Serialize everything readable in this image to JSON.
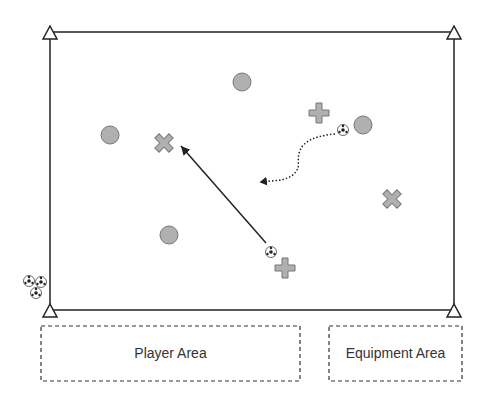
{
  "diagram": {
    "field": {
      "x": 50,
      "y": 32,
      "width": 404,
      "height": 278,
      "stroke": "#222"
    },
    "cones": [
      {
        "x": 50,
        "y": 32
      },
      {
        "x": 454,
        "y": 32
      },
      {
        "x": 50,
        "y": 310
      },
      {
        "x": 454,
        "y": 310
      }
    ],
    "circles": [
      {
        "x": 242,
        "y": 82
      },
      {
        "x": 110,
        "y": 135
      },
      {
        "x": 363,
        "y": 125
      },
      {
        "x": 169,
        "y": 235
      }
    ],
    "crosses": [
      {
        "x": 164,
        "y": 143,
        "rot": 45
      },
      {
        "x": 319,
        "y": 113,
        "rot": 0
      },
      {
        "x": 392,
        "y": 199,
        "rot": 45
      },
      {
        "x": 285,
        "y": 268,
        "rot": 0
      }
    ],
    "balls": [
      {
        "x": 343,
        "y": 130
      },
      {
        "x": 271,
        "y": 252
      },
      {
        "x": 29,
        "y": 281
      },
      {
        "x": 41,
        "y": 282
      },
      {
        "x": 36,
        "y": 293
      }
    ],
    "pass_arrow": {
      "x1": 266,
      "y1": 243,
      "x2": 180,
      "y2": 145
    },
    "dribble_path": "M 335 134 C 290 138, 300 160, 298 168 C 292 182, 275 180, 260 182",
    "colors": {
      "fill": "#b0b0b0",
      "stroke": "#777777"
    }
  },
  "areas": {
    "player": {
      "label": "Player Area"
    },
    "equipment": {
      "label": "Equipment Area"
    }
  }
}
